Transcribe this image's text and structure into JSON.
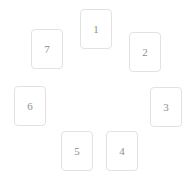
{
  "layout": {
    "arrangement": "circle",
    "card_count": 7,
    "canvas_width": 192,
    "canvas_height": 183,
    "background_color": "#ffffff",
    "card_border_color": "#e2e2e2",
    "card_fill_color": "#ffffff",
    "card_text_color": "#8e8e8e"
  },
  "cards": [
    {
      "label": "1",
      "position": "top"
    },
    {
      "label": "2",
      "position": "upper-right"
    },
    {
      "label": "3",
      "position": "right"
    },
    {
      "label": "4",
      "position": "lower-right"
    },
    {
      "label": "5",
      "position": "lower-left"
    },
    {
      "label": "6",
      "position": "left"
    },
    {
      "label": "7",
      "position": "upper-left"
    }
  ]
}
